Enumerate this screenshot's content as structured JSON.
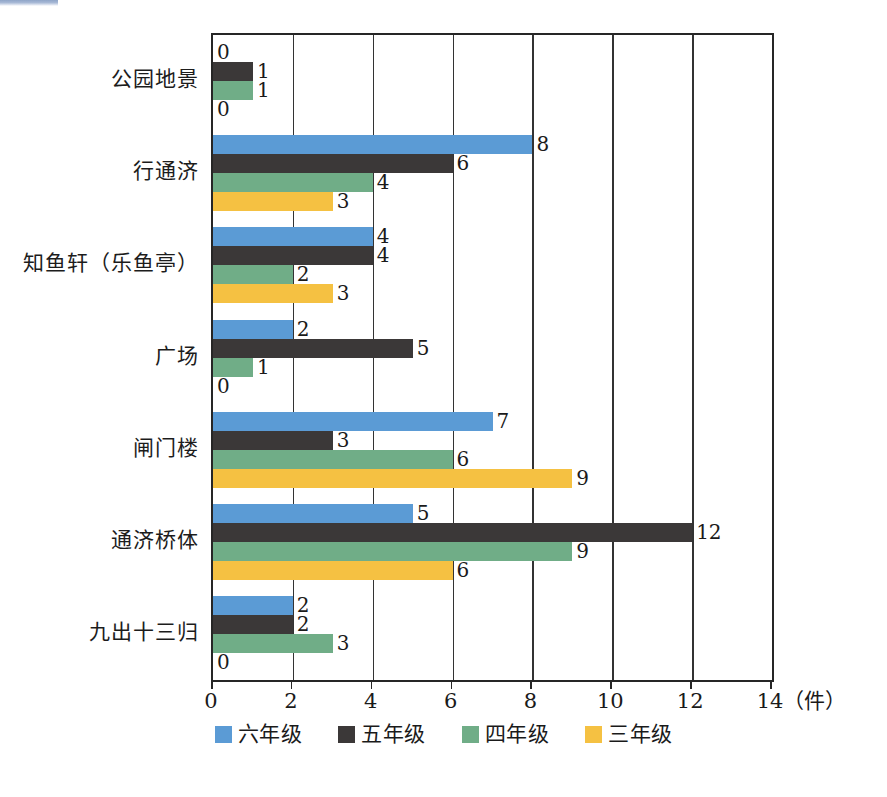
{
  "chart_data": {
    "type": "bar",
    "orientation": "horizontal",
    "title": "",
    "xlabel": "（件）",
    "ylabel": "",
    "xlim": [
      0,
      14
    ],
    "xticks": [
      0,
      2,
      4,
      6,
      8,
      10,
      12,
      14
    ],
    "xtick_labels": [
      "0",
      "2",
      "4",
      "6",
      "8",
      "10",
      "12",
      "14"
    ],
    "grid": true,
    "legend_position": "bottom-center",
    "categories": [
      "公园地景",
      "行通济",
      "知鱼轩（乐鱼亭）",
      "广场",
      "闸门楼",
      "通济桥体",
      "九出十三归"
    ],
    "series": [
      {
        "name": "六年级",
        "color": "#5b9bd5",
        "values": [
          0,
          8,
          4,
          2,
          7,
          5,
          2
        ]
      },
      {
        "name": "五年级",
        "color": "#3b3838",
        "values": [
          1,
          6,
          4,
          5,
          3,
          12,
          2
        ]
      },
      {
        "name": "四年级",
        "color": "#70ad87",
        "values": [
          1,
          4,
          2,
          1,
          6,
          9,
          3
        ]
      },
      {
        "name": "三年级",
        "color": "#f5c142",
        "values": [
          0,
          3,
          3,
          0,
          9,
          6,
          0
        ]
      }
    ],
    "data_labels": [
      [
        "0",
        "1",
        "1",
        "0"
      ],
      [
        "8",
        "6",
        "4",
        "3"
      ],
      [
        "4",
        "4",
        "2",
        "3"
      ],
      [
        "2",
        "5",
        "1",
        "0"
      ],
      [
        "7",
        "3",
        "6",
        "9"
      ],
      [
        "5",
        "12",
        "9",
        "6"
      ],
      [
        "2",
        "2",
        "3",
        "0"
      ]
    ]
  },
  "axis": {
    "unit_label": "（件）"
  },
  "legend": {
    "items": [
      {
        "label": "六年级",
        "color": "#5b9bd5"
      },
      {
        "label": "五年级",
        "color": "#3b3838"
      },
      {
        "label": "四年级",
        "color": "#70ad87"
      },
      {
        "label": "三年级",
        "color": "#f5c142"
      }
    ]
  },
  "colors": {
    "grade6": "#5b9bd5",
    "grade5": "#3b3838",
    "grade4": "#70ad87",
    "grade3": "#f5c142",
    "axis": "#262626",
    "text": "#1a1a1a",
    "background": "#ffffff"
  }
}
